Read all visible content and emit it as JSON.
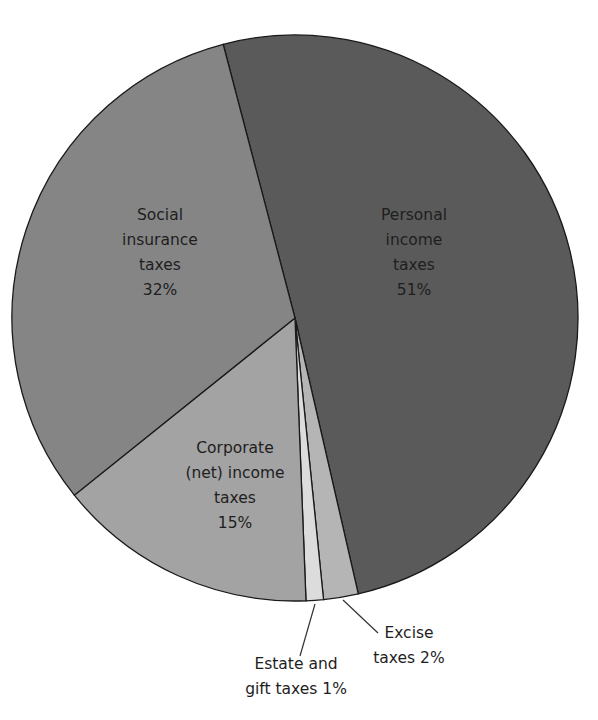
{
  "chart_data": {
    "type": "pie",
    "title": "",
    "start_angle_deg": -14.7,
    "direction": "clockwise",
    "slices": [
      {
        "label": "Personal income taxes",
        "value": 51,
        "color": "#5a5a5a"
      },
      {
        "label": "Excise taxes",
        "value": 2,
        "color": "#b5b5b5"
      },
      {
        "label": "Estate and gift taxes",
        "value": 1,
        "color": "#dcdcdc"
      },
      {
        "label": "Corporate (net) income taxes",
        "value": 15,
        "color": "#a3a3a3"
      },
      {
        "label": "Social insurance taxes",
        "value": 32,
        "color": "#858585"
      }
    ]
  },
  "labels": {
    "personal": [
      "Personal",
      "income",
      "taxes",
      "51%"
    ],
    "social": [
      "Social",
      "insurance",
      "taxes",
      "32%"
    ],
    "corporate": [
      "Corporate",
      "(net) income",
      "taxes",
      "15%"
    ],
    "excise": [
      "Excise",
      "taxes 2%"
    ],
    "estate": [
      "Estate and",
      "gift taxes 1%"
    ]
  }
}
